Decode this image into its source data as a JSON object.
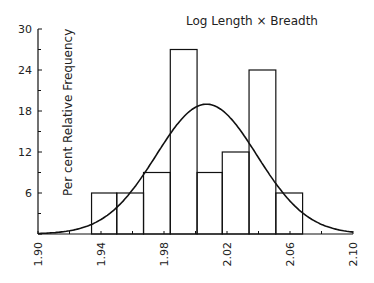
{
  "chart_data": {
    "type": "bar",
    "subtype": "histogram_with_normal_curve",
    "title": "Log Length × Breadth",
    "xlabel": "",
    "ylabel": "Per cent Relative Frequency",
    "xlim": [
      1.9,
      2.1
    ],
    "ylim": [
      0,
      30
    ],
    "x_ticks": [
      "1.90",
      "1.94",
      "1.98",
      "2.02",
      "2.06",
      "2.10"
    ],
    "x_tick_values": [
      1.9,
      1.94,
      1.98,
      2.02,
      2.06,
      2.1
    ],
    "y_ticks": [
      "6",
      "12",
      "18",
      "24",
      "30"
    ],
    "y_tick_values": [
      6,
      12,
      18,
      24,
      30
    ],
    "bin_edges": [
      1.934,
      1.95,
      1.967,
      1.984,
      2.001,
      2.017,
      2.034,
      2.051,
      2.068
    ],
    "values": [
      6,
      6,
      9,
      27,
      9,
      12,
      24,
      6
    ],
    "normal_curve": {
      "mean": 2.007,
      "peak": 19,
      "sd": 0.032
    },
    "grid": false,
    "legend": null
  }
}
